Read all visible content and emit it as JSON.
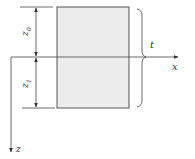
{
  "diagram": {
    "labels": {
      "z0": "z",
      "z0_sub": "0",
      "z1": "z",
      "z1_sub": "1",
      "thickness": "t",
      "x_axis": "x",
      "z_axis": "z"
    },
    "colors": {
      "stroke": "#444444",
      "plate_fill": "#ececec",
      "plate_stroke": "#555555"
    }
  }
}
